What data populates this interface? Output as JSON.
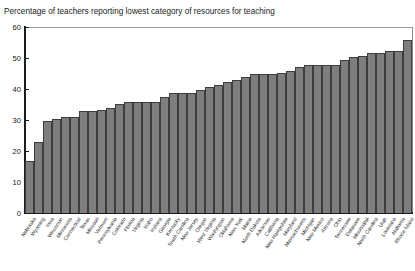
{
  "corner_note": "",
  "chart_data": {
    "type": "bar",
    "title": "Percentage of teachers reporting lowest category of resources for teaching",
    "xlabel": "",
    "ylabel": "",
    "ylim": [
      0,
      60
    ],
    "yticks": [
      0,
      10,
      20,
      30,
      40,
      50,
      60
    ],
    "grid": false,
    "legend": null,
    "bar_color": "#7e7e7e",
    "bar_edge_color": "#3d3d3d",
    "categories": [
      "Nebraska",
      "Wyoming",
      "Iowa",
      "Wisconsin",
      "Minnesota",
      "Connecticut",
      "Texas",
      "Missouri",
      "Vermont",
      "Pennsylvania",
      "Colorado",
      "Florida",
      "Virginia",
      "Idaho",
      "Indiana",
      "Georgia",
      "Kentucky",
      "South Carolina",
      "New Jersey",
      "Oregon",
      "West Virginia",
      "Washington",
      "Oklahoma",
      "New York",
      "Maine",
      "North Dakota",
      "Arkansas",
      "California",
      "New Hampshire",
      "Maryland",
      "Massachusetts",
      "Michigan",
      "New Mexico",
      "Arizona",
      "Ohio",
      "Tennessee",
      "Delaware",
      "Mississippi",
      "North Carolina",
      "Utah",
      "Louisiana",
      "Alabama",
      "Rhode Island"
    ],
    "values": [
      17,
      23,
      30,
      30.5,
      31,
      31,
      33,
      33,
      33.5,
      34,
      35.5,
      36,
      36,
      36,
      36,
      37.5,
      39,
      39,
      39,
      40,
      41,
      41.5,
      42.5,
      43,
      44,
      45,
      45,
      45,
      45.5,
      46,
      47.5,
      48,
      48,
      48,
      48,
      49.5,
      50.5,
      51,
      52,
      52,
      52.5,
      52.5,
      56
    ]
  }
}
